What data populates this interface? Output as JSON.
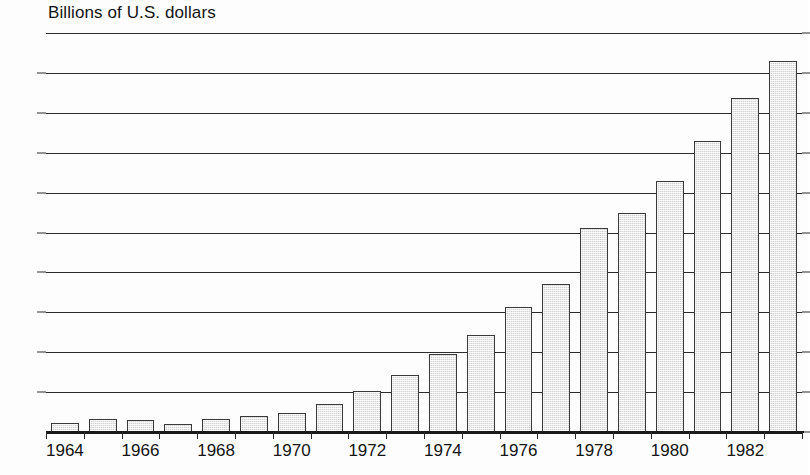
{
  "chart": {
    "axis_title": "Billions of U.S. dollars"
  },
  "chart_data": {
    "type": "bar",
    "title": "",
    "subtitle": "",
    "xlabel": "",
    "ylabel": "Billions of U.S. dollars",
    "ylim": [
      0,
      100
    ],
    "xlim_categories": [
      "1964",
      "1965",
      "1966",
      "1967",
      "1968",
      "1969",
      "1970",
      "1971",
      "1972",
      "1973",
      "1974",
      "1975",
      "1976",
      "1977",
      "1978",
      "1979",
      "1980",
      "1981",
      "1982",
      "1983"
    ],
    "categories": [
      "1964",
      "1965",
      "1966",
      "1967",
      "1968",
      "1969",
      "1970",
      "1971",
      "1972",
      "1973",
      "1974",
      "1975",
      "1976",
      "1977",
      "1978",
      "1979",
      "1980",
      "1981",
      "1982",
      "1983"
    ],
    "values": [
      2.3,
      3.2,
      3.1,
      2.1,
      3.2,
      3.9,
      4.8,
      7.1,
      10.4,
      14.2,
      19.6,
      24.4,
      31.4,
      37.1,
      51.1,
      55.0,
      62.8,
      72.9,
      83.8,
      93.0
    ],
    "y_ticks": [
      0,
      10,
      20,
      30,
      40,
      50,
      60,
      70,
      80,
      90,
      100
    ],
    "y_tick_labels": [
      "0",
      "10",
      "20",
      "30",
      "40",
      "50",
      "60",
      "70",
      "80",
      "90",
      "100"
    ],
    "x_tick_labels_shown": [
      "1964",
      "1966",
      "1968",
      "1970",
      "1972",
      "1974",
      "1976",
      "1978",
      "1980",
      "1982"
    ],
    "grid": true,
    "grid_axis": "y",
    "legend": null,
    "legend_position": "none",
    "bar_fill_color": "#d2d2d2",
    "bar_edge_color": "#3a3a3a",
    "axis_color": "#2c2c2c",
    "background_color": "#ffffff",
    "annotations": []
  }
}
